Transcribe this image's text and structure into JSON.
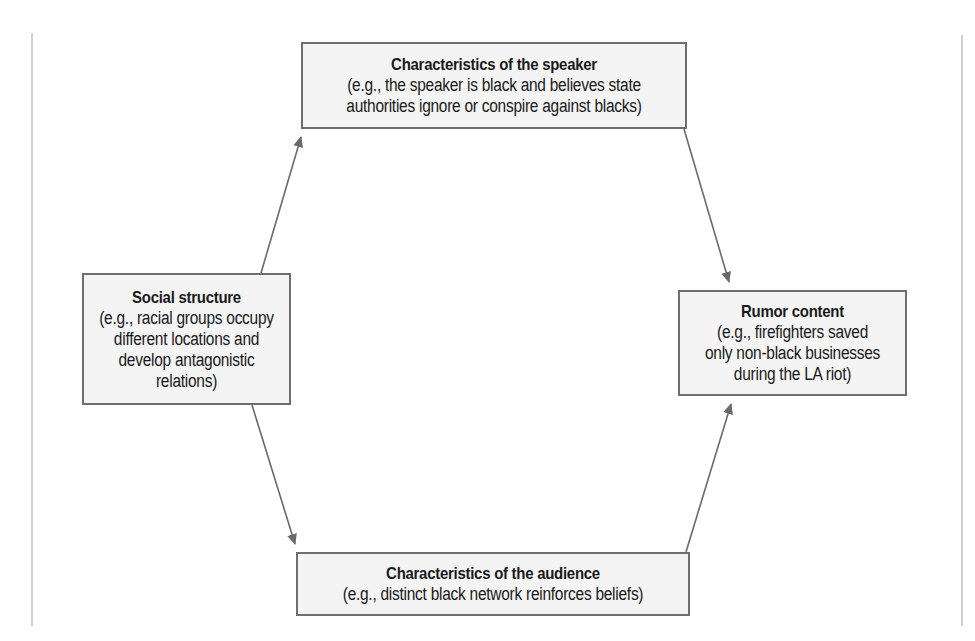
{
  "diagram": {
    "nodes": {
      "speaker": {
        "title": "Characteristics of the speaker",
        "lines": [
          "(e.g., the speaker is black and believes state",
          "authorities ignore or conspire against blacks)"
        ]
      },
      "social": {
        "title": "Social structure",
        "lines": [
          "(e.g., racial groups occupy",
          "different locations and",
          "develop antagonistic",
          "relations)"
        ]
      },
      "rumor": {
        "title": "Rumor content",
        "lines": [
          "(e.g., firefighters saved",
          "only non-black businesses",
          "during the LA riot)"
        ]
      },
      "audience": {
        "title": "Characteristics of the audience",
        "lines": [
          "(e.g., distinct black network reinforces beliefs)"
        ]
      }
    },
    "edges": [
      {
        "from": "Social structure",
        "to": "Characteristics of the speaker"
      },
      {
        "from": "Characteristics of the speaker",
        "to": "Rumor content"
      },
      {
        "from": "Social structure",
        "to": "Characteristics of the audience"
      },
      {
        "from": "Characteristics of the audience",
        "to": "Rumor content"
      }
    ],
    "colors": {
      "box_fill": "#f4f4f4",
      "box_border": "#6e6e6e",
      "arrow": "#6a6a6a",
      "page_rule": "#cfcfcf"
    }
  }
}
